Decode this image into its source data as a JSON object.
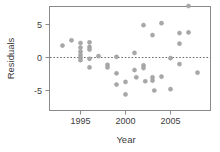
{
  "chart_data": {
    "type": "scatter",
    "title": "",
    "xlabel": "Year",
    "ylabel": "Residuals",
    "xlim": [
      1992.4,
      2008.6
    ],
    "ylim": [
      -8.2,
      8.6
    ],
    "xticks": [
      1995,
      2000,
      2005
    ],
    "xtick_labels": [
      "1995",
      "2000",
      "2005"
    ],
    "yticks": [
      5,
      0,
      -5
    ],
    "ytick_labels": [
      "5",
      "0",
      "-5"
    ],
    "grid": false,
    "legend": null,
    "annotations": [
      {
        "kind": "reference-line",
        "axis": "y",
        "value": 0,
        "style": "dashed"
      }
    ],
    "marker": {
      "shape": "circle",
      "fill": "#a8a8a8",
      "stroke": "#949494",
      "size_px": 2.1
    },
    "points": [
      {
        "x": 1993.0,
        "y": 1.8
      },
      {
        "x": 1994.0,
        "y": 2.6
      },
      {
        "x": 1995.0,
        "y": 2.2
      },
      {
        "x": 1995.0,
        "y": 1.5
      },
      {
        "x": 1995.0,
        "y": 0.9
      },
      {
        "x": 1995.0,
        "y": 0.4
      },
      {
        "x": 1995.0,
        "y": 0.0
      },
      {
        "x": 1995.0,
        "y": -0.4
      },
      {
        "x": 1996.0,
        "y": 2.3
      },
      {
        "x": 1996.0,
        "y": 1.6
      },
      {
        "x": 1996.0,
        "y": 1.2
      },
      {
        "x": 1996.0,
        "y": -0.2
      },
      {
        "x": 1996.0,
        "y": -1.5
      },
      {
        "x": 1997.0,
        "y": 0.2
      },
      {
        "x": 1998.0,
        "y": -1.1
      },
      {
        "x": 1998.0,
        "y": -1.5
      },
      {
        "x": 1999.0,
        "y": 0.1
      },
      {
        "x": 1999.0,
        "y": -2.4
      },
      {
        "x": 1999.0,
        "y": -4.1
      },
      {
        "x": 2000.0,
        "y": -3.7
      },
      {
        "x": 2000.0,
        "y": -5.6
      },
      {
        "x": 2001.0,
        "y": 0.7
      },
      {
        "x": 2001.0,
        "y": -1.9
      },
      {
        "x": 2001.2,
        "y": -3.0
      },
      {
        "x": 2002.0,
        "y": 4.9
      },
      {
        "x": 2002.0,
        "y": -1.2
      },
      {
        "x": 2002.0,
        "y": -1.6
      },
      {
        "x": 2002.2,
        "y": -3.6
      },
      {
        "x": 2003.0,
        "y": 3.4
      },
      {
        "x": 2003.0,
        "y": -3.0
      },
      {
        "x": 2003.0,
        "y": -3.5
      },
      {
        "x": 2003.2,
        "y": -5.0
      },
      {
        "x": 2004.0,
        "y": 5.2
      },
      {
        "x": 2004.0,
        "y": -2.9
      },
      {
        "x": 2005.0,
        "y": -0.1
      },
      {
        "x": 2005.0,
        "y": -4.8
      },
      {
        "x": 2006.0,
        "y": 3.7
      },
      {
        "x": 2006.0,
        "y": 2.1
      },
      {
        "x": 2006.0,
        "y": -1.0
      },
      {
        "x": 2007.0,
        "y": 7.8
      },
      {
        "x": 2007.0,
        "y": 3.8
      },
      {
        "x": 2008.0,
        "y": -2.3
      }
    ]
  }
}
